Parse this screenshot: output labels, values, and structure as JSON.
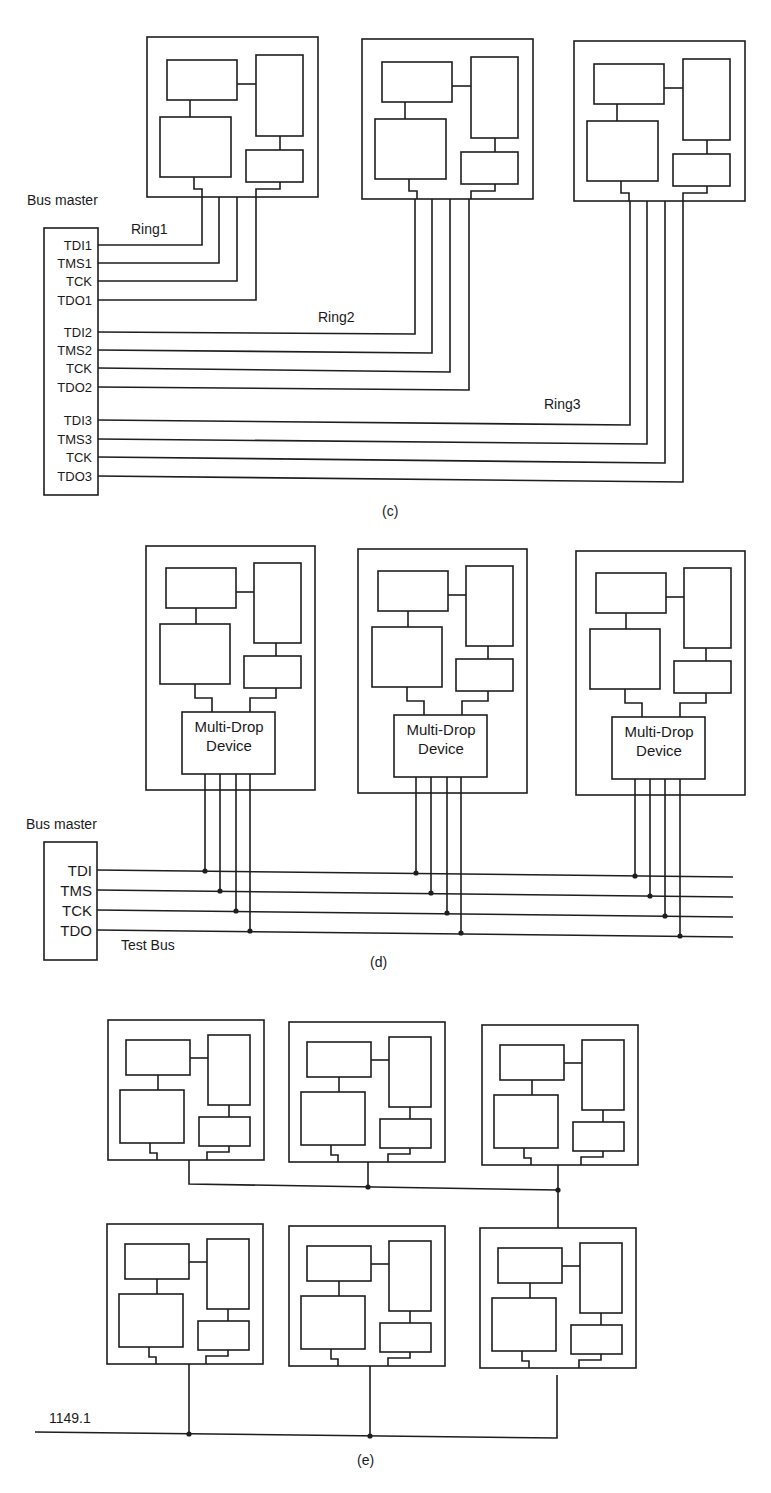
{
  "figure": {
    "colors": {
      "line": "#1e1e1e",
      "background": "#ffffff",
      "text": "#1a1a1a"
    },
    "panel_c": {
      "caption": "(c)",
      "bus_master_label": "Bus master",
      "pins": [
        "TDI1",
        "TMS1",
        "TCK",
        "TDO1",
        "TDI2",
        "TMS2",
        "TCK",
        "TDO2",
        "TDI3",
        "TMS3",
        "TCK",
        "TDO3"
      ],
      "rings": [
        "Ring1",
        "Ring2",
        "Ring3"
      ],
      "board_count": 3
    },
    "panel_d": {
      "caption": "(d)",
      "bus_master_label": "Bus master",
      "pins": [
        "TDI",
        "TMS",
        "TCK",
        "TDO"
      ],
      "bus_label": "Test Bus",
      "devices": [
        {
          "line1": "Multi-Drop",
          "line2": "Device"
        },
        {
          "line1": "Multi-Drop",
          "line2": "Device"
        },
        {
          "line1": "Multi-Drop",
          "line2": "Device"
        }
      ],
      "board_count": 3
    },
    "panel_e": {
      "caption": "(e)",
      "bus_label": "1149.1",
      "rows": 2,
      "boards_per_row": 3
    }
  }
}
